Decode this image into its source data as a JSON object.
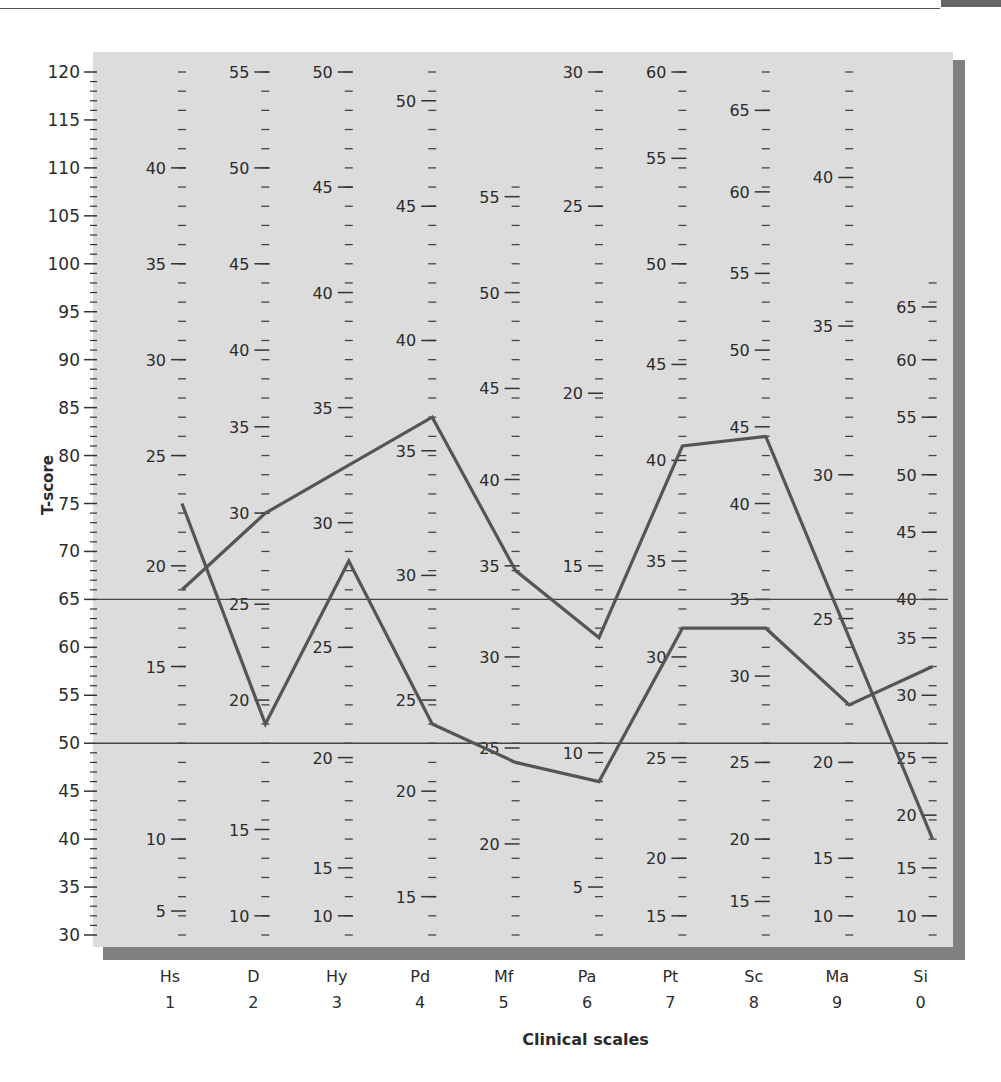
{
  "header": {
    "running_text": ""
  },
  "chart_data": {
    "type": "line",
    "title": "",
    "xlabel": "Clinical scales",
    "ylabel": "T-score",
    "ylim": [
      30,
      120
    ],
    "y_ticks_major": [
      30,
      35,
      40,
      45,
      50,
      55,
      60,
      65,
      70,
      75,
      80,
      85,
      90,
      95,
      100,
      105,
      110,
      115,
      120
    ],
    "reference_lines": [
      65,
      50
    ],
    "grid": false,
    "legend": null,
    "categories": [
      {
        "abbr": "Hs",
        "num": "1"
      },
      {
        "abbr": "D",
        "num": "2"
      },
      {
        "abbr": "Hy",
        "num": "3"
      },
      {
        "abbr": "Pd",
        "num": "4"
      },
      {
        "abbr": "Mf",
        "num": "5"
      },
      {
        "abbr": "Pa",
        "num": "6"
      },
      {
        "abbr": "Pt",
        "num": "7"
      },
      {
        "abbr": "Sc",
        "num": "8"
      },
      {
        "abbr": "Ma",
        "num": "9"
      },
      {
        "abbr": "Si",
        "num": "0"
      }
    ],
    "series": [
      {
        "name": "Profile A",
        "points": [
          {
            "scale": "Hs",
            "t": 66
          },
          {
            "scale": "D",
            "t": 74
          },
          {
            "scale": "Pd",
            "t": 84
          },
          {
            "scale": "Mf",
            "t": 68
          },
          {
            "scale": "Pa",
            "t": 61
          },
          {
            "scale": "Pt",
            "t": 81
          },
          {
            "scale": "Sc",
            "t": 82
          },
          {
            "scale": "Si",
            "t": 40
          }
        ]
      },
      {
        "name": "Profile B",
        "points": [
          {
            "scale": "Hs",
            "t": 75
          },
          {
            "scale": "D",
            "t": 52
          },
          {
            "scale": "Hy",
            "t": 69
          },
          {
            "scale": "Pd",
            "t": 52
          },
          {
            "scale": "Mf",
            "t": 48
          },
          {
            "scale": "Pa",
            "t": 46
          },
          {
            "scale": "Pt",
            "t": 62
          },
          {
            "scale": "Sc",
            "t": 62
          },
          {
            "scale": "Ma",
            "t": 54
          },
          {
            "scale": "Si",
            "t": 58
          }
        ]
      }
    ],
    "raw_score_columns": [
      {
        "scale": "Hs",
        "labels": [
          {
            "raw": 40,
            "t": 110
          },
          {
            "raw": 35,
            "t": 100
          },
          {
            "raw": 30,
            "t": 90
          },
          {
            "raw": 25,
            "t": 80
          },
          {
            "raw": 20,
            "t": 68.5
          },
          {
            "raw": 15,
            "t": 58
          },
          {
            "raw": 10,
            "t": 40
          },
          {
            "raw": 5,
            "t": 32.5
          }
        ],
        "top_t": 120,
        "bottom_t": 30
      },
      {
        "scale": "D",
        "labels": [
          {
            "raw": 55,
            "t": 120
          },
          {
            "raw": 50,
            "t": 110
          },
          {
            "raw": 45,
            "t": 100
          },
          {
            "raw": 40,
            "t": 91
          },
          {
            "raw": 35,
            "t": 83
          },
          {
            "raw": 30,
            "t": 74
          },
          {
            "raw": 25,
            "t": 64.5
          },
          {
            "raw": 20,
            "t": 54.5
          },
          {
            "raw": 15,
            "t": 41
          },
          {
            "raw": 10,
            "t": 32
          }
        ],
        "top_t": 120,
        "bottom_t": 30
      },
      {
        "scale": "Hy",
        "labels": [
          {
            "raw": 50,
            "t": 120
          },
          {
            "raw": 45,
            "t": 108
          },
          {
            "raw": 40,
            "t": 97
          },
          {
            "raw": 35,
            "t": 85
          },
          {
            "raw": 30,
            "t": 73
          },
          {
            "raw": 25,
            "t": 60
          },
          {
            "raw": 20,
            "t": 48.5
          },
          {
            "raw": 15,
            "t": 37
          },
          {
            "raw": 10,
            "t": 32
          }
        ],
        "top_t": 120,
        "bottom_t": 30
      },
      {
        "scale": "Pd",
        "labels": [
          {
            "raw": 50,
            "t": 117
          },
          {
            "raw": 45,
            "t": 106
          },
          {
            "raw": 40,
            "t": 92
          },
          {
            "raw": 35,
            "t": 80.5
          },
          {
            "raw": 30,
            "t": 67.5
          },
          {
            "raw": 25,
            "t": 54.5
          },
          {
            "raw": 20,
            "t": 45
          },
          {
            "raw": 15,
            "t": 34
          }
        ],
        "top_t": 120,
        "bottom_t": 30
      },
      {
        "scale": "Mf",
        "labels": [
          {
            "raw": 55,
            "t": 107
          },
          {
            "raw": 50,
            "t": 97
          },
          {
            "raw": 45,
            "t": 87
          },
          {
            "raw": 40,
            "t": 77.5
          },
          {
            "raw": 35,
            "t": 68.5
          },
          {
            "raw": 30,
            "t": 59
          },
          {
            "raw": 25,
            "t": 49.5
          },
          {
            "raw": 20,
            "t": 39.5
          }
        ],
        "top_t": 109,
        "bottom_t": 30
      },
      {
        "scale": "Pa",
        "labels": [
          {
            "raw": 30,
            "t": 120
          },
          {
            "raw": 25,
            "t": 106
          },
          {
            "raw": 20,
            "t": 86.5
          },
          {
            "raw": 15,
            "t": 68.5
          },
          {
            "raw": 10,
            "t": 49
          },
          {
            "raw": 5,
            "t": 35
          }
        ],
        "top_t": 120,
        "bottom_t": 30
      },
      {
        "scale": "Pt",
        "labels": [
          {
            "raw": 60,
            "t": 120
          },
          {
            "raw": 55,
            "t": 111
          },
          {
            "raw": 50,
            "t": 100
          },
          {
            "raw": 45,
            "t": 89.5
          },
          {
            "raw": 40,
            "t": 79.5
          },
          {
            "raw": 35,
            "t": 69
          },
          {
            "raw": 30,
            "t": 59
          },
          {
            "raw": 25,
            "t": 48.5
          },
          {
            "raw": 20,
            "t": 38
          },
          {
            "raw": 15,
            "t": 32
          }
        ],
        "top_t": 120,
        "bottom_t": 30
      },
      {
        "scale": "Sc",
        "labels": [
          {
            "raw": 65,
            "t": 116
          },
          {
            "raw": 60,
            "t": 107.5
          },
          {
            "raw": 55,
            "t": 99
          },
          {
            "raw": 50,
            "t": 91
          },
          {
            "raw": 45,
            "t": 83
          },
          {
            "raw": 40,
            "t": 75
          },
          {
            "raw": 35,
            "t": 65
          },
          {
            "raw": 30,
            "t": 57
          },
          {
            "raw": 25,
            "t": 48
          },
          {
            "raw": 20,
            "t": 40
          },
          {
            "raw": 15,
            "t": 33.5
          }
        ],
        "top_t": 120,
        "bottom_t": 30
      },
      {
        "scale": "Ma",
        "labels": [
          {
            "raw": 40,
            "t": 109
          },
          {
            "raw": 35,
            "t": 93.5
          },
          {
            "raw": 30,
            "t": 78
          },
          {
            "raw": 25,
            "t": 63
          },
          {
            "raw": 20,
            "t": 48
          },
          {
            "raw": 15,
            "t": 38
          },
          {
            "raw": 10,
            "t": 32
          }
        ],
        "top_t": 120,
        "bottom_t": 30
      },
      {
        "scale": "Si",
        "labels": [
          {
            "raw": 65,
            "t": 95.5
          },
          {
            "raw": 60,
            "t": 90
          },
          {
            "raw": 55,
            "t": 84
          },
          {
            "raw": 50,
            "t": 78
          },
          {
            "raw": 45,
            "t": 72
          },
          {
            "raw": 40,
            "t": 65
          },
          {
            "raw": 35,
            "t": 61
          },
          {
            "raw": 30,
            "t": 55
          },
          {
            "raw": 25,
            "t": 48.5
          },
          {
            "raw": 20,
            "t": 42.5
          },
          {
            "raw": 15,
            "t": 37
          },
          {
            "raw": 10,
            "t": 32
          }
        ],
        "top_t": 99,
        "bottom_t": 30
      }
    ]
  },
  "colors": {
    "panel_bg": "#dcdcdc",
    "panel_shadow": "#6a6a6a",
    "line": "#555555",
    "ref_line": "#444444",
    "text": "#2b2b2b"
  }
}
